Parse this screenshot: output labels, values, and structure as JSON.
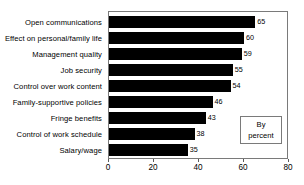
{
  "chart_data": {
    "type": "bar",
    "orientation": "horizontal",
    "title": "",
    "subtitle": "",
    "xlabel": "",
    "ylabel": "",
    "categories": [
      "Open communications",
      "Effect on personal/family life",
      "Management quality",
      "Job security",
      "Control over work content",
      "Family-supportive policies",
      "Fringe benefits",
      "Control of work schedule",
      "Salary/wage"
    ],
    "values": [
      65,
      60,
      59,
      55,
      54,
      46,
      43,
      38,
      35
    ],
    "data_labels": [
      "65",
      "60",
      "59",
      "55",
      "54",
      "46",
      "43",
      "38",
      "35"
    ],
    "xlim": [
      0,
      80
    ],
    "xticks": [
      0,
      20,
      40,
      60,
      80
    ],
    "xtick_labels": [
      "0",
      "20",
      "40",
      "60",
      "80"
    ],
    "grid": false,
    "legend_position": "inside-bottom-right",
    "annotations": [
      "By percent"
    ],
    "bar_color": "#000000",
    "frame_color": "#7a7a7a",
    "background_color": "#ffffff"
  },
  "legend": {
    "line1": "By",
    "line2": "percent"
  }
}
